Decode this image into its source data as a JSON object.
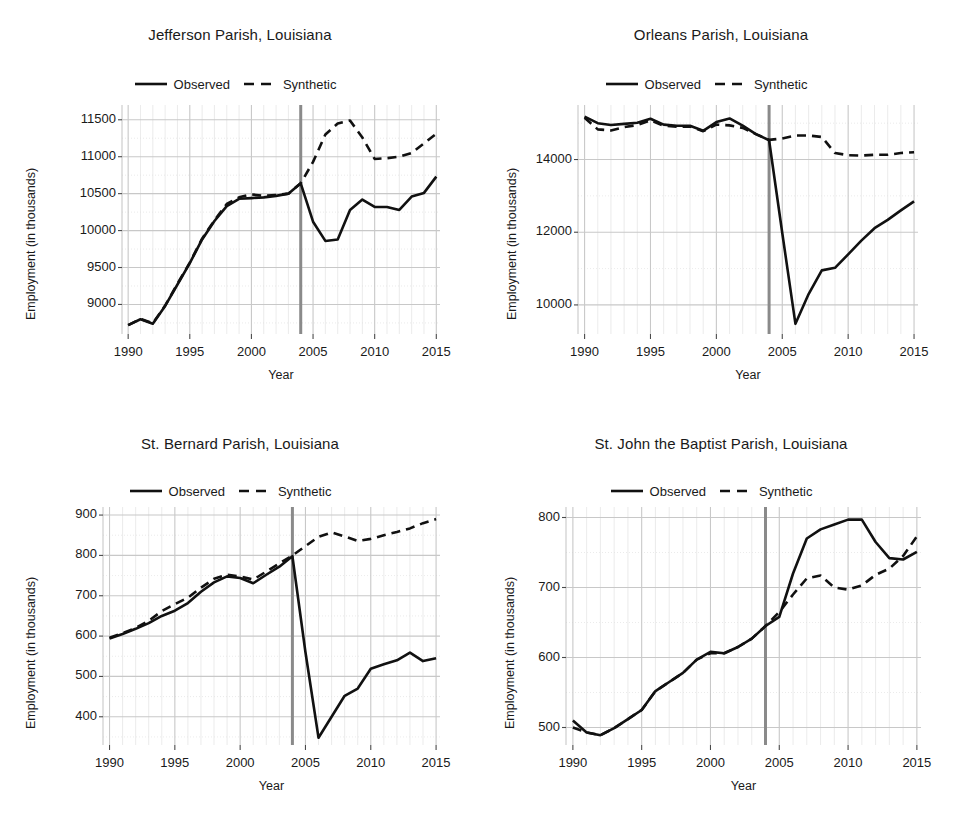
{
  "figure": {
    "width": 961,
    "height": 817,
    "background": "#ffffff",
    "series_color": "#111111",
    "grid_color": "#c8c8c8",
    "minor_grid_color": "#e2e2e2",
    "intervention_color": "#8a8a8a"
  },
  "legend": {
    "observed_label": "Observed",
    "synthetic_label": "Synthetic"
  },
  "axis": {
    "xlabel": "Year",
    "ylabel": "Employment (in thousands)"
  },
  "chart_data": [
    {
      "type": "line",
      "title": "Jefferson Parish, Louisiana",
      "xlabel": "Year",
      "ylabel": "Employment (in thousands)",
      "xlim": [
        1989.5,
        2015.3
      ],
      "ylim": [
        8600,
        11700
      ],
      "xticks": [
        1990,
        1995,
        2000,
        2005,
        2010,
        2015
      ],
      "yticks": [
        9000,
        9500,
        10000,
        10500,
        11000,
        11500
      ],
      "grid": true,
      "legend_position": "top-center",
      "intervention_year": 2004,
      "x": [
        1990,
        1991,
        1992,
        1993,
        1994,
        1995,
        1996,
        1997,
        1998,
        1999,
        2000,
        2001,
        2002,
        2003,
        2004,
        2005,
        2006,
        2007,
        2008,
        2009,
        2010,
        2011,
        2012,
        2013,
        2014,
        2015
      ],
      "series": [
        {
          "name": "Observed",
          "style": "solid",
          "values": [
            8720,
            8800,
            8740,
            8980,
            9270,
            9560,
            9880,
            10130,
            10330,
            10430,
            10440,
            10450,
            10470,
            10500,
            10640,
            10120,
            9860,
            9880,
            10280,
            10420,
            10320,
            10320,
            10280,
            10460,
            10510,
            10730
          ]
        },
        {
          "name": "Synthetic",
          "style": "dashed",
          "values": [
            8720,
            8805,
            8745,
            8985,
            9280,
            9565,
            9890,
            10140,
            10360,
            10450,
            10490,
            10470,
            10480,
            10500,
            10640,
            10930,
            11300,
            11450,
            11490,
            11260,
            10970,
            10980,
            11000,
            11050,
            11180,
            11310
          ]
        }
      ]
    },
    {
      "type": "line",
      "title": "Orleans Parish, Louisiana",
      "xlabel": "Year",
      "ylabel": "Employment (in thousands)",
      "xlim": [
        1989.5,
        2015.3
      ],
      "ylim": [
        9200,
        15500
      ],
      "xticks": [
        1990,
        1995,
        2000,
        2005,
        2010,
        2015
      ],
      "yticks": [
        10000,
        12000,
        14000
      ],
      "grid": true,
      "legend_position": "top-center",
      "intervention_year": 2004,
      "x": [
        1990,
        1991,
        1992,
        1993,
        1994,
        1995,
        1996,
        1997,
        1998,
        1999,
        2000,
        2001,
        2002,
        2003,
        2004,
        2005,
        2006,
        2007,
        2008,
        2009,
        2010,
        2011,
        2012,
        2013,
        2014,
        2015
      ],
      "series": [
        {
          "name": "Observed",
          "style": "solid",
          "values": [
            15180,
            15000,
            14950,
            14980,
            15010,
            15120,
            14960,
            14930,
            14930,
            14790,
            15030,
            15130,
            14930,
            14700,
            14530,
            11980,
            9480,
            10300,
            10950,
            11020,
            11390,
            11770,
            12110,
            12340,
            12600,
            12850
          ]
        },
        {
          "name": "Synthetic",
          "style": "dashed",
          "values": [
            15150,
            14830,
            14800,
            14890,
            14950,
            15080,
            14930,
            14900,
            14910,
            14780,
            14960,
            14940,
            14870,
            14700,
            14540,
            14580,
            14660,
            14660,
            14620,
            14180,
            14120,
            14110,
            14130,
            14130,
            14180,
            14200
          ]
        }
      ]
    },
    {
      "type": "line",
      "title": "St. Bernard Parish, Louisiana",
      "xlabel": "Year",
      "ylabel": "Employment (in thousands)",
      "xlim": [
        1989.5,
        2015.3
      ],
      "ylim": [
        330,
        920
      ],
      "xticks": [
        1990,
        1995,
        2000,
        2005,
        2010,
        2015
      ],
      "yticks": [
        400,
        500,
        600,
        700,
        800,
        900
      ],
      "grid": true,
      "legend_position": "top-center",
      "intervention_year": 2004,
      "x": [
        1990,
        1991,
        1992,
        1993,
        1994,
        1995,
        1996,
        1997,
        1998,
        1999,
        2000,
        2001,
        2002,
        2003,
        2004,
        2005,
        2006,
        2007,
        2008,
        2009,
        2010,
        2011,
        2012,
        2013,
        2014,
        2015
      ],
      "series": [
        {
          "name": "Observed",
          "style": "solid",
          "values": [
            594,
            605,
            618,
            632,
            650,
            663,
            682,
            710,
            733,
            748,
            744,
            731,
            752,
            772,
            798,
            560,
            348,
            400,
            452,
            470,
            519,
            530,
            540,
            559,
            538,
            545
          ]
        },
        {
          "name": "Synthetic",
          "style": "dashed",
          "values": [
            596,
            607,
            620,
            638,
            662,
            679,
            695,
            720,
            742,
            752,
            748,
            740,
            760,
            780,
            800,
            823,
            846,
            857,
            847,
            836,
            841,
            850,
            858,
            867,
            880,
            890
          ]
        }
      ]
    },
    {
      "type": "line",
      "title": "St. John the Baptist Parish, Louisiana",
      "xlabel": "Year",
      "ylabel": "Employment (in thousands)",
      "xlim": [
        1989.5,
        2015.3
      ],
      "ylim": [
        475,
        815
      ],
      "xticks": [
        1990,
        1995,
        2000,
        2005,
        2010,
        2015
      ],
      "yticks": [
        500,
        600,
        700,
        800
      ],
      "grid": true,
      "legend_position": "top-center",
      "intervention_year": 2004,
      "x": [
        1990,
        1991,
        1992,
        1993,
        1994,
        1995,
        1996,
        1997,
        1998,
        1999,
        2000,
        2001,
        2002,
        2003,
        2004,
        2005,
        2006,
        2007,
        2008,
        2009,
        2010,
        2011,
        2012,
        2013,
        2014,
        2015
      ],
      "series": [
        {
          "name": "Observed",
          "style": "solid",
          "values": [
            510,
            493,
            489,
            499,
            512,
            525,
            552,
            565,
            578,
            597,
            608,
            606,
            615,
            627,
            645,
            658,
            720,
            770,
            783,
            790,
            797,
            797,
            765,
            742,
            740,
            751
          ]
        },
        {
          "name": "Synthetic",
          "style": "dashed",
          "values": [
            500,
            493,
            489,
            499,
            512,
            525,
            552,
            565,
            578,
            597,
            606,
            606,
            615,
            627,
            645,
            665,
            690,
            713,
            717,
            700,
            697,
            703,
            718,
            727,
            745,
            773
          ]
        }
      ]
    }
  ]
}
